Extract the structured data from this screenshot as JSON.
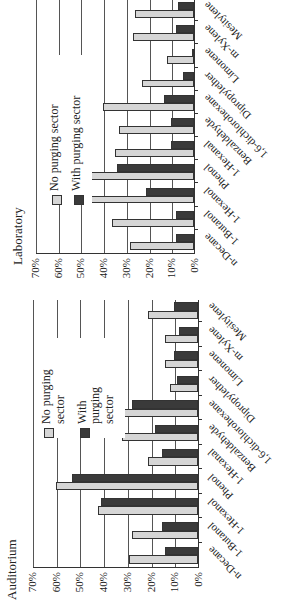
{
  "chart_data": [
    {
      "type": "bar",
      "title": "Laboratory",
      "xlabel": "",
      "ylabel": "",
      "ylim": [
        0,
        70
      ],
      "yticks": [
        "0%",
        "10%",
        "20%",
        "30%",
        "40%",
        "50%",
        "60%",
        "70%"
      ],
      "grid": true,
      "legend_position": "upper right",
      "categories": [
        "n-Decane",
        "1-Butanol",
        "1-Hexanol",
        "Phenol",
        "1-Hexanal",
        "Benzaldehyde",
        "1,6-dichlorohexane",
        "Dipropylether",
        "Limonene",
        "m-Xylene",
        "Mesitylene"
      ],
      "series": [
        {
          "name": "No purging sector",
          "color": "#d6d6d6",
          "values": [
            28,
            36,
            51,
            64,
            35,
            33,
            40,
            23,
            12,
            27,
            26
          ]
        },
        {
          "name": "With purging sector",
          "color": "#3a3a3a",
          "values": [
            8,
            8,
            21,
            34,
            10,
            10,
            13,
            5,
            1,
            8,
            7
          ]
        }
      ]
    },
    {
      "type": "bar",
      "title": "Auditorium",
      "xlabel": "",
      "ylabel": "",
      "ylim": [
        0,
        70
      ],
      "yticks": [
        "0%",
        "10%",
        "20%",
        "30%",
        "40%",
        "50%",
        "60%",
        "70%"
      ],
      "grid": true,
      "legend_position": "upper right",
      "categories": [
        "n-Decane",
        "1-Butanol",
        "1-Hexanol",
        "Phenol",
        "1-Hexanal",
        "Benzaldehyde",
        "1,6-dichlorohexane",
        "Dipropylether",
        "Limonene",
        "m-Xylene",
        "Mesitylene"
      ],
      "series": [
        {
          "name": "No purging sector",
          "color": "#d6d6d6",
          "values": [
            29,
            28,
            42,
            60,
            21,
            32,
            57,
            12,
            14,
            14,
            21
          ]
        },
        {
          "name": "With purging sector",
          "color": "#3a3a3a",
          "values": [
            14,
            15,
            41,
            53,
            15,
            18,
            28,
            9,
            10,
            8,
            10
          ]
        }
      ]
    }
  ],
  "charts": {
    "lab": {
      "title": "Laboratory",
      "legend": {
        "no_purging": "No purging sector",
        "with_purging": "With purging sector"
      }
    },
    "aud": {
      "title": "Auditorium",
      "legend": {
        "no_purging": "No purging sector",
        "with_purging": "With purging sector"
      }
    }
  }
}
